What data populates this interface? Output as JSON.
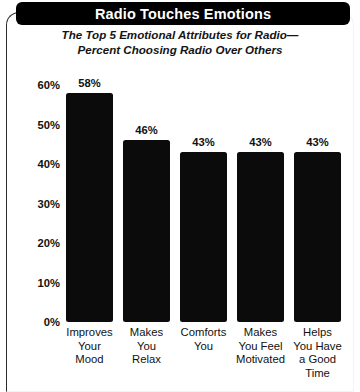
{
  "title": "Radio Touches Emotions",
  "subtitle_line1": "The Top 5 Emotional Attributes for Radio—",
  "subtitle_line2": "Percent Choosing Radio Over Others",
  "colors": {
    "bar": "#0b0b0b",
    "title_bar_background": "#000000",
    "title_text": "#ffffff",
    "text": "#111111",
    "frame_border": "#2b2b2b",
    "page_background": "#ffffff"
  },
  "chart_data": {
    "type": "bar",
    "title": "Radio Touches Emotions",
    "subtitle": "The Top 5 Emotional Attributes for Radio—Percent Choosing Radio Over Others",
    "categories": [
      "Improves Your Mood",
      "Makes You Relax",
      "Comforts You",
      "Makes You Feel Motivated",
      "Helps You Have a Good Time"
    ],
    "category_lines": [
      [
        "Improves",
        "Your",
        "Mood"
      ],
      [
        "Makes",
        "You",
        "Relax"
      ],
      [
        "Comforts",
        "You"
      ],
      [
        "Makes",
        "You Feel",
        "Motivated"
      ],
      [
        "Helps",
        "You Have",
        "a Good",
        "Time"
      ]
    ],
    "values": [
      58,
      46,
      43,
      43,
      43
    ],
    "data_labels": [
      "58%",
      "46%",
      "43%",
      "43%",
      "43%"
    ],
    "xlabel": "",
    "ylabel": "",
    "ylim": [
      0,
      60
    ],
    "ytick_values": [
      0,
      10,
      20,
      30,
      40,
      50,
      60
    ],
    "ytick_labels": [
      "0%",
      "10%",
      "20%",
      "30%",
      "40%",
      "50%",
      "60%"
    ],
    "grid": false,
    "legend": null,
    "units": "percent"
  }
}
